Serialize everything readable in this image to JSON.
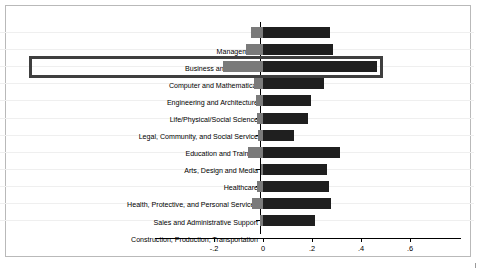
{
  "chart_data": {
    "type": "bar",
    "orientation": "horizontal",
    "title": "",
    "subtitle": "",
    "xlabel": "",
    "ylabel": "",
    "xlim": [
      -0.3,
      0.66
    ],
    "grid": true,
    "legend": null,
    "zero_line": 0,
    "xticks": [
      -0.2,
      0,
      0.2,
      0.4,
      0.6
    ],
    "xticklabels": [
      "-.2",
      "0",
      ".2",
      ".4",
      ".6"
    ],
    "categories": [
      "Management",
      "Business and Financial",
      "Computer and Mathematical",
      "Engineering and Architecture",
      "Life/Physical/Social Science",
      "Legal, Community, and Social Service",
      "Education and Training",
      "Arts, Design and Media",
      "Healthcare",
      "Health, Protective, and Personal Services",
      "Sales and Administrative Support",
      "Construction, Production, Transportation"
    ],
    "series": [
      {
        "name": "negative-segment",
        "color": "#7a7a7a",
        "values": [
          -0.05,
          -0.07,
          -0.163,
          -0.037,
          -0.028,
          -0.024,
          -0.02,
          -0.06,
          -0.008,
          -0.025,
          -0.045,
          -0.012
        ]
      },
      {
        "name": "positive-segment",
        "color": "#1f1f1f",
        "values": [
          0.272,
          0.285,
          0.465,
          0.249,
          0.196,
          0.184,
          0.126,
          0.314,
          0.261,
          0.269,
          0.278,
          0.212
        ]
      }
    ],
    "highlight": {
      "category": "Computer and Mathematical",
      "index": 2,
      "color": "#3f3f3f",
      "style": "rectangle-outline"
    }
  }
}
